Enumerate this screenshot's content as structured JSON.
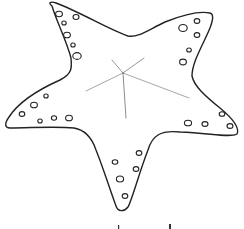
{
  "image": {
    "subject": "starfish line drawing",
    "background_color": "#ffffff",
    "outline_color": "#222222",
    "center_line_color": "#666666"
  },
  "starfish": {
    "arms": [
      "top-left",
      "top-right",
      "left",
      "right",
      "bottom"
    ],
    "spots": [
      {
        "cx": 59,
        "cy": 14,
        "rx": 3.4,
        "ry": 2.7
      },
      {
        "cx": 76,
        "cy": 17,
        "rx": 3,
        "ry": 2.5
      },
      {
        "cx": 64,
        "cy": 23,
        "rx": 2.2,
        "ry": 2
      },
      {
        "cx": 67,
        "cy": 35,
        "rx": 3.4,
        "ry": 2.8
      },
      {
        "cx": 73,
        "cy": 45,
        "rx": 2.2,
        "ry": 2
      },
      {
        "cx": 77,
        "cy": 56,
        "rx": 4.2,
        "ry": 3.4
      },
      {
        "cx": 183,
        "cy": 28,
        "rx": 4.2,
        "ry": 3.5
      },
      {
        "cx": 197,
        "cy": 21,
        "rx": 2.8,
        "ry": 2.4
      },
      {
        "cx": 197,
        "cy": 35,
        "rx": 2.8,
        "ry": 2.4
      },
      {
        "cx": 189,
        "cy": 50,
        "rx": 2.3,
        "ry": 2
      },
      {
        "cx": 183,
        "cy": 62,
        "rx": 3.4,
        "ry": 2.9
      },
      {
        "cx": 46,
        "cy": 96,
        "rx": 2.2,
        "ry": 2
      },
      {
        "cx": 34,
        "cy": 105,
        "rx": 3.4,
        "ry": 2.8
      },
      {
        "cx": 22,
        "cy": 114,
        "rx": 2.8,
        "ry": 2.4
      },
      {
        "cx": 40,
        "cy": 121,
        "rx": 2.2,
        "ry": 2
      },
      {
        "cx": 54,
        "cy": 118,
        "rx": 2.6,
        "ry": 2.2
      },
      {
        "cx": 69,
        "cy": 118,
        "rx": 3.4,
        "ry": 2.8
      },
      {
        "cx": 188,
        "cy": 123,
        "rx": 3.6,
        "ry": 2.8
      },
      {
        "cx": 205,
        "cy": 124,
        "rx": 3,
        "ry": 2.4
      },
      {
        "cx": 222,
        "cy": 114,
        "rx": 2.8,
        "ry": 2.3
      },
      {
        "cx": 230,
        "cy": 126,
        "rx": 3,
        "ry": 2.4
      },
      {
        "cx": 139,
        "cy": 153,
        "rx": 2.8,
        "ry": 2.4
      },
      {
        "cx": 115,
        "cy": 162,
        "rx": 2.8,
        "ry": 2.2
      },
      {
        "cx": 136,
        "cy": 169,
        "rx": 2.8,
        "ry": 2.4
      },
      {
        "cx": 120,
        "cy": 179,
        "rx": 3.6,
        "ry": 3
      },
      {
        "cx": 125,
        "cy": 196,
        "rx": 2.8,
        "ry": 2.4
      }
    ]
  }
}
